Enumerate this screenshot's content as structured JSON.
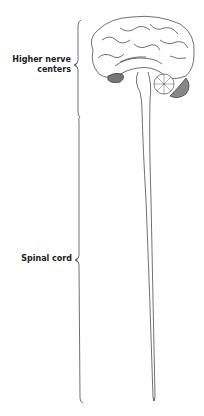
{
  "diagram": {
    "labels": {
      "higher_nerve_centers_line1": "Higher nerve",
      "higher_nerve_centers_line2": "centers",
      "spinal_cord": "Spinal cord"
    },
    "colors": {
      "line": "#333333",
      "shade": "#777777",
      "background": "#ffffff"
    }
  }
}
